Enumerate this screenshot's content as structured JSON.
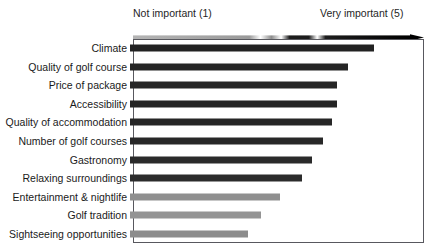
{
  "chart_data": {
    "type": "bar",
    "title": "",
    "subtitle": "",
    "xlabel": "",
    "ylabel": "",
    "orientation": "horizontal",
    "xlim": [
      1,
      5
    ],
    "grid": false,
    "legend_position": "top",
    "scale_labels": {
      "low": "Not important (1)",
      "high": "Very important (5)"
    },
    "legend_entries": [
      "Not important (1)",
      "Very important (5)"
    ],
    "annotations": [],
    "colors": {
      "bar_dark": "#222222",
      "bar_mid": "#6e6e6e",
      "bar_light": "#9a9a9a",
      "frame": "#58585e",
      "text": "#1a1a1a",
      "background": "#ffffff"
    },
    "categories": [
      "Climate",
      "Quality of golf course",
      "Price of package",
      "Accessibility",
      "Quality of accommodation",
      "Number of golf courses",
      "Gastronomy",
      "Relaxing surroundings",
      "Entertainment & nightlife",
      "Golf tradition",
      "Sightseeing opportunities"
    ],
    "values": [
      4.35,
      4.0,
      3.85,
      3.85,
      3.77,
      3.65,
      3.5,
      3.37,
      3.06,
      2.8,
      2.62
    ],
    "bar_colors": [
      "#222222",
      "#252525",
      "#262626",
      "#242424",
      "#262626",
      "#282828",
      "#2a2a2a",
      "#2c2c2c",
      "#8f8f8f",
      "#949494",
      "#8c8c8c"
    ]
  },
  "icons": {
    "gradient_arrow": "gradient-arrow-icon"
  }
}
